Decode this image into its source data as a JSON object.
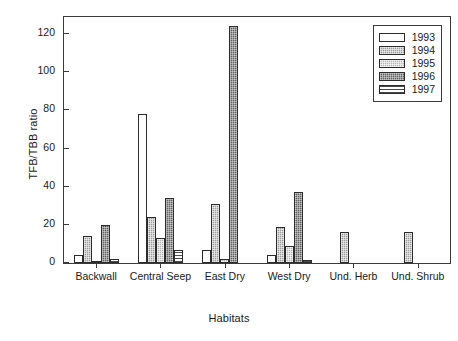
{
  "chart_data": {
    "type": "bar",
    "title": "",
    "xlabel": "Habitats",
    "ylabel": "TFB/TBB ratio",
    "categories": [
      "Backwall",
      "Central Seep",
      "East Dry",
      "West Dry",
      "Und. Herb",
      "Und. Shrub"
    ],
    "series": [
      {
        "name": "1993",
        "color": "#ffffff",
        "pattern": "solid-white",
        "values": [
          4,
          78,
          7,
          4,
          0,
          0
        ]
      },
      {
        "name": "1994",
        "color": "#9a9a9a",
        "pattern": "dotted-medium",
        "values": [
          14,
          24,
          31,
          19,
          16,
          16
        ]
      },
      {
        "name": "1995",
        "color": "#b4b4b4",
        "pattern": "dotted-light",
        "values": [
          1,
          13,
          2,
          9,
          0,
          0
        ]
      },
      {
        "name": "1996",
        "color": "#5f5f5f",
        "pattern": "dotted-dark",
        "values": [
          20,
          34,
          124,
          37,
          0,
          0
        ]
      },
      {
        "name": "1997",
        "color": "#ffffff",
        "pattern": "horizontal-lines",
        "values": [
          2,
          7,
          0,
          1.5,
          0,
          0
        ]
      }
    ],
    "ylim": [
      0,
      130
    ],
    "yticks": [
      0,
      20,
      40,
      60,
      80,
      100,
      120
    ],
    "grid": false,
    "legend_position": "top-right"
  },
  "legend": {
    "entries": [
      "1993",
      "1994",
      "1995",
      "1996",
      "1997"
    ]
  }
}
